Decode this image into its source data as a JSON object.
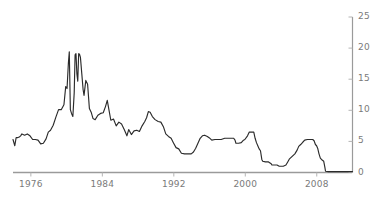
{
  "chart_data": {
    "type": "line",
    "title": "",
    "subtitle": "",
    "xlabel": "",
    "ylabel": "",
    "xlim": [
      1974.0,
      2012.0
    ],
    "ylim": [
      0,
      25
    ],
    "grid": false,
    "legend": null,
    "y_axis_position": "right",
    "x_ticks": [
      1976,
      1984,
      1992,
      2000,
      2008
    ],
    "x_tick_labels": [
      "1976",
      "1984",
      "1992",
      "2000",
      "2008"
    ],
    "y_ticks": [
      0,
      5,
      10,
      15,
      20,
      25
    ],
    "y_tick_labels": [
      "0",
      "5",
      "10",
      "15",
      "20",
      "25"
    ],
    "series": [
      {
        "name": "Federal funds rate",
        "color": "#2b2b2b",
        "x": [
          1974.0,
          1974.2,
          1974.35,
          1974.5,
          1974.7,
          1974.85,
          1975.0,
          1975.3,
          1975.6,
          1975.9,
          1976.2,
          1976.5,
          1976.8,
          1977.1,
          1977.4,
          1977.7,
          1977.95,
          1978.2,
          1978.5,
          1978.8,
          1979.1,
          1979.4,
          1979.7,
          1979.9,
          1980.05,
          1980.2,
          1980.3,
          1980.42,
          1980.55,
          1980.7,
          1980.85,
          1980.95,
          1981.05,
          1981.15,
          1981.25,
          1981.35,
          1981.45,
          1981.55,
          1981.7,
          1981.85,
          1981.95,
          1982.15,
          1982.35,
          1982.55,
          1982.75,
          1982.95,
          1983.2,
          1983.5,
          1983.8,
          1984.1,
          1984.35,
          1984.55,
          1984.75,
          1984.95,
          1985.25,
          1985.55,
          1985.85,
          1986.15,
          1986.45,
          1986.75,
          1986.95,
          1987.25,
          1987.55,
          1987.85,
          1988.15,
          1988.45,
          1988.75,
          1988.95,
          1989.15,
          1989.35,
          1989.6,
          1989.9,
          1990.25,
          1990.55,
          1990.85,
          1991.1,
          1991.4,
          1991.7,
          1991.95,
          1992.25,
          1992.55,
          1992.85,
          1993.2,
          1993.6,
          1993.95,
          1994.2,
          1994.45,
          1994.7,
          1994.95,
          1995.2,
          1995.45,
          1995.75,
          1995.95,
          1996.25,
          1996.6,
          1996.95,
          1997.3,
          1997.7,
          1997.95,
          1998.3,
          1998.7,
          1998.85,
          1998.95,
          1999.25,
          1999.55,
          1999.8,
          1999.95,
          2000.25,
          2000.45,
          2000.7,
          2000.95,
          2001.1,
          2001.25,
          2001.4,
          2001.55,
          2001.7,
          2001.85,
          2001.95,
          2002.25,
          2002.6,
          2002.9,
          2002.98,
          2003.25,
          2003.55,
          2003.8,
          2003.95,
          2004.25,
          2004.55,
          2004.75,
          2004.95,
          2005.25,
          2005.55,
          2005.8,
          2005.98,
          2006.2,
          2006.45,
          2006.65,
          2006.95,
          2007.25,
          2007.55,
          2007.7,
          2007.85,
          2007.98,
          2008.1,
          2008.25,
          2008.4,
          2008.6,
          2008.78,
          2008.9,
          2008.98,
          2009.3,
          2009.7,
          2010.0,
          2010.5,
          2011.0,
          2011.5,
          2012.0
        ],
        "y": [
          5.3,
          4.3,
          5.6,
          5.6,
          5.7,
          5.9,
          6.2,
          6.0,
          6.2,
          5.9,
          5.3,
          5.3,
          5.2,
          4.6,
          4.7,
          5.4,
          6.5,
          6.8,
          7.6,
          8.9,
          10.1,
          10.1,
          10.9,
          13.8,
          13.5,
          17.6,
          19.4,
          10.1,
          9.5,
          9.0,
          12.8,
          18.9,
          19.1,
          15.9,
          14.7,
          19.1,
          19.0,
          18.5,
          15.9,
          13.3,
          12.4,
          14.8,
          14.2,
          10.3,
          9.7,
          8.7,
          8.5,
          9.2,
          9.5,
          9.6,
          10.6,
          11.6,
          10.0,
          8.4,
          8.6,
          7.5,
          8.1,
          7.8,
          6.9,
          5.9,
          6.9,
          6.1,
          6.7,
          6.8,
          6.6,
          7.5,
          8.2,
          8.8,
          9.8,
          9.7,
          9.0,
          8.5,
          8.2,
          8.1,
          7.3,
          6.2,
          5.8,
          5.5,
          4.8,
          4.0,
          3.8,
          3.1,
          3.0,
          3.0,
          3.0,
          3.3,
          3.9,
          4.7,
          5.5,
          5.9,
          6.0,
          5.8,
          5.6,
          5.2,
          5.3,
          5.3,
          5.3,
          5.5,
          5.5,
          5.5,
          5.5,
          5.2,
          4.7,
          4.7,
          4.8,
          5.2,
          5.3,
          5.9,
          6.5,
          6.5,
          6.5,
          5.5,
          4.8,
          4.3,
          3.8,
          3.5,
          2.1,
          1.8,
          1.7,
          1.7,
          1.4,
          1.2,
          1.2,
          1.2,
          1.0,
          1.0,
          1.0,
          1.2,
          1.7,
          2.2,
          2.6,
          3.0,
          3.6,
          4.2,
          4.5,
          4.9,
          5.2,
          5.3,
          5.3,
          5.3,
          5.1,
          4.5,
          4.3,
          3.9,
          3.0,
          2.3,
          2.0,
          1.8,
          0.9,
          0.2,
          0.15,
          0.15,
          0.15,
          0.15,
          0.15,
          0.15,
          0.15
        ]
      }
    ]
  },
  "axis": {
    "line_color": "#9a9a9a",
    "tick_color": "#b5b5b5",
    "label_color": "#7a7a7a"
  }
}
